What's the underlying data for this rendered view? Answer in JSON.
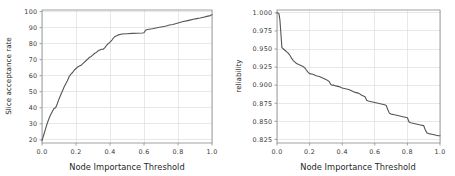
{
  "figure": {
    "background_color": "#ffffff",
    "line_color": "#555555",
    "grid_color": "#d9d9d9",
    "axis_color": "#8a8a8a"
  },
  "chart_data": [
    {
      "type": "line",
      "panel": "left",
      "title": "",
      "xlabel": "Node Importance Threshold",
      "ylabel": "Slice acceptance rate",
      "xlim": [
        0.0,
        1.0
      ],
      "ylim": [
        18.0,
        101.0
      ],
      "grid": true,
      "legend": "none",
      "xticks": [
        "0.0",
        "0.2",
        "0.4",
        "0.6",
        "0.8",
        "1.0"
      ],
      "xtick_values": [
        0.0,
        0.2,
        0.4,
        0.6,
        0.8,
        1.0
      ],
      "yticks": [
        "20",
        "30",
        "40",
        "50",
        "60",
        "70",
        "80",
        "90",
        "100"
      ],
      "ytick_values": [
        20,
        30,
        40,
        50,
        60,
        70,
        80,
        90,
        100
      ],
      "x": [
        0.0,
        0.01,
        0.02,
        0.03,
        0.04,
        0.05,
        0.06,
        0.07,
        0.08,
        0.09,
        0.1,
        0.11,
        0.12,
        0.13,
        0.14,
        0.15,
        0.16,
        0.17,
        0.18,
        0.19,
        0.2,
        0.21,
        0.22,
        0.23,
        0.24,
        0.25,
        0.26,
        0.27,
        0.28,
        0.29,
        0.3,
        0.31,
        0.32,
        0.33,
        0.34,
        0.35,
        0.36,
        0.37,
        0.38,
        0.39,
        0.4,
        0.41,
        0.42,
        0.43,
        0.44,
        0.45,
        0.47,
        0.5,
        0.53,
        0.56,
        0.59,
        0.6,
        0.61,
        0.63,
        0.65,
        0.67,
        0.69,
        0.71,
        0.73,
        0.75,
        0.77,
        0.79,
        0.81,
        0.83,
        0.85,
        0.87,
        0.89,
        0.91,
        0.93,
        0.95,
        0.97,
        0.99,
        1.0
      ],
      "y": [
        19.5,
        23.0,
        26.5,
        30.0,
        33.0,
        35.5,
        37.5,
        39.5,
        40.0,
        42.5,
        45.5,
        48.0,
        50.5,
        53.0,
        55.0,
        57.0,
        59.5,
        61.0,
        62.0,
        63.5,
        64.5,
        65.5,
        66.0,
        66.5,
        67.5,
        68.5,
        69.5,
        70.5,
        71.5,
        72.0,
        73.0,
        74.0,
        74.5,
        75.5,
        76.0,
        76.5,
        76.5,
        77.5,
        79.0,
        80.0,
        81.0,
        82.0,
        83.5,
        84.5,
        85.0,
        85.5,
        86.0,
        86.2,
        86.4,
        86.5,
        86.6,
        86.8,
        88.5,
        89.0,
        89.3,
        89.8,
        90.2,
        90.6,
        91.0,
        91.6,
        92.0,
        92.6,
        93.2,
        93.8,
        94.2,
        94.7,
        95.2,
        95.6,
        96.0,
        96.5,
        97.0,
        97.5,
        98.0
      ]
    },
    {
      "type": "line",
      "panel": "right",
      "title": "",
      "xlabel": "Node Importance Threshold",
      "ylabel": "reliability",
      "xlim": [
        0.0,
        1.0
      ],
      "ylim": [
        0.82,
        1.004
      ],
      "grid": true,
      "legend": "none",
      "xticks": [
        "0.0",
        "0.2",
        "0.4",
        "0.6",
        "0.8",
        "1.0"
      ],
      "xtick_values": [
        0.0,
        0.2,
        0.4,
        0.6,
        0.8,
        1.0
      ],
      "yticks": [
        "0.825",
        "0.850",
        "0.875",
        "0.900",
        "0.925",
        "0.950",
        "0.975",
        "1.000"
      ],
      "ytick_values": [
        0.825,
        0.85,
        0.875,
        0.9,
        0.925,
        0.95,
        0.975,
        1.0
      ],
      "x": [
        0.0,
        0.005,
        0.012,
        0.018,
        0.025,
        0.03,
        0.04,
        0.05,
        0.06,
        0.07,
        0.08,
        0.09,
        0.1,
        0.11,
        0.12,
        0.13,
        0.14,
        0.15,
        0.16,
        0.17,
        0.18,
        0.19,
        0.2,
        0.22,
        0.24,
        0.26,
        0.28,
        0.3,
        0.32,
        0.33,
        0.34,
        0.35,
        0.36,
        0.38,
        0.4,
        0.42,
        0.44,
        0.46,
        0.48,
        0.5,
        0.52,
        0.54,
        0.55,
        0.56,
        0.58,
        0.6,
        0.62,
        0.64,
        0.66,
        0.67,
        0.68,
        0.69,
        0.7,
        0.72,
        0.74,
        0.76,
        0.78,
        0.8,
        0.81,
        0.82,
        0.84,
        0.86,
        0.88,
        0.9,
        0.91,
        0.92,
        0.93,
        0.95,
        0.97,
        0.99,
        1.0
      ],
      "y": [
        1.0,
        1.0,
        0.999,
        0.99,
        0.968,
        0.952,
        0.95,
        0.948,
        0.946,
        0.944,
        0.941,
        0.937,
        0.934,
        0.932,
        0.93,
        0.929,
        0.928,
        0.927,
        0.926,
        0.924,
        0.921,
        0.918,
        0.916,
        0.915,
        0.913,
        0.912,
        0.91,
        0.908,
        0.905,
        0.901,
        0.9,
        0.9,
        0.899,
        0.898,
        0.896,
        0.895,
        0.894,
        0.892,
        0.89,
        0.889,
        0.886,
        0.884,
        0.879,
        0.878,
        0.877,
        0.876,
        0.875,
        0.874,
        0.873,
        0.872,
        0.866,
        0.861,
        0.86,
        0.859,
        0.858,
        0.857,
        0.856,
        0.855,
        0.849,
        0.848,
        0.847,
        0.846,
        0.845,
        0.844,
        0.838,
        0.834,
        0.833,
        0.832,
        0.831,
        0.83,
        0.83
      ]
    }
  ]
}
